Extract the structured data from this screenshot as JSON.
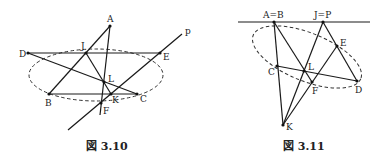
{
  "figures": [
    {
      "id": "fig-3-10",
      "caption": "図 3.10",
      "labels": {
        "A": "A",
        "B": "B",
        "C": "C",
        "D": "D",
        "E": "E",
        "F": "F",
        "J": "J",
        "K": "K",
        "L": "L",
        "p": "p"
      },
      "points": {
        "A": [
          110,
          26
        ],
        "B": [
          49,
          94
        ],
        "C": [
          137,
          94
        ],
        "D": [
          28,
          53
        ],
        "E": [
          160,
          53
        ],
        "F": [
          101,
          103
        ],
        "J": [
          86,
          53
        ],
        "K": [
          111,
          94
        ],
        "L": [
          104,
          82
        ]
      },
      "ellipse": {
        "cx": 96,
        "cy": 75,
        "rx": 67,
        "ry": 26,
        "style": "dashed"
      },
      "line_p": {
        "from": [
          68,
          130
        ],
        "to": [
          182,
          34
        ]
      }
    },
    {
      "id": "fig-3-11",
      "caption": "図 3.11",
      "labels": {
        "AB": "A=B",
        "JP": "J=P",
        "C": "C",
        "D": "D",
        "E": "E",
        "F": "F",
        "K": "K",
        "L": "L"
      },
      "points": {
        "AB": [
          274,
          22
        ],
        "JP": [
          323,
          22
        ],
        "C": [
          277,
          66
        ],
        "D": [
          357,
          81
        ],
        "E": [
          337,
          46
        ],
        "F": [
          312,
          82
        ],
        "K": [
          283,
          125
        ],
        "L": [
          304,
          71
        ]
      },
      "ellipse": {
        "cx": 307,
        "cy": 58,
        "rx": 58,
        "ry": 25,
        "rotate": 22,
        "style": "dashed"
      },
      "top_line": {
        "from": [
          238,
          22
        ],
        "to": [
          370,
          22
        ]
      }
    }
  ]
}
